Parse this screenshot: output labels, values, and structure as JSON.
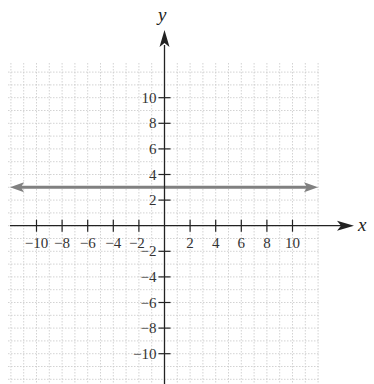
{
  "chart_data": {
    "type": "line",
    "title": "",
    "xlabel": "x",
    "ylabel": "y",
    "xlim": [
      -12,
      12
    ],
    "ylim": [
      -12,
      12
    ],
    "grid": true,
    "x_ticks": [
      -10,
      -8,
      -6,
      -4,
      -2,
      2,
      4,
      6,
      8,
      10
    ],
    "y_ticks": [
      -10,
      -8,
      -6,
      -4,
      -2,
      2,
      4,
      6,
      8,
      10
    ],
    "x_tick_labels": [
      "−10",
      "−8",
      "−6",
      "−4",
      "−2",
      "2",
      "4",
      "6",
      "8",
      "10"
    ],
    "y_tick_labels": [
      "−10",
      "−8",
      "−6",
      "−4",
      "−2",
      "2",
      "4",
      "6",
      "8",
      "10"
    ],
    "series": [
      {
        "name": "y = 3",
        "equation": "y = 3",
        "x": [
          -12,
          12
        ],
        "y": [
          3,
          3
        ],
        "color": "#808080",
        "arrows_both_ends": true
      }
    ]
  },
  "axes": {
    "x_name": "x",
    "y_name": "y",
    "axis_color": "#222222",
    "grid_color": "#c8c8c8",
    "line_color": "#808080"
  }
}
